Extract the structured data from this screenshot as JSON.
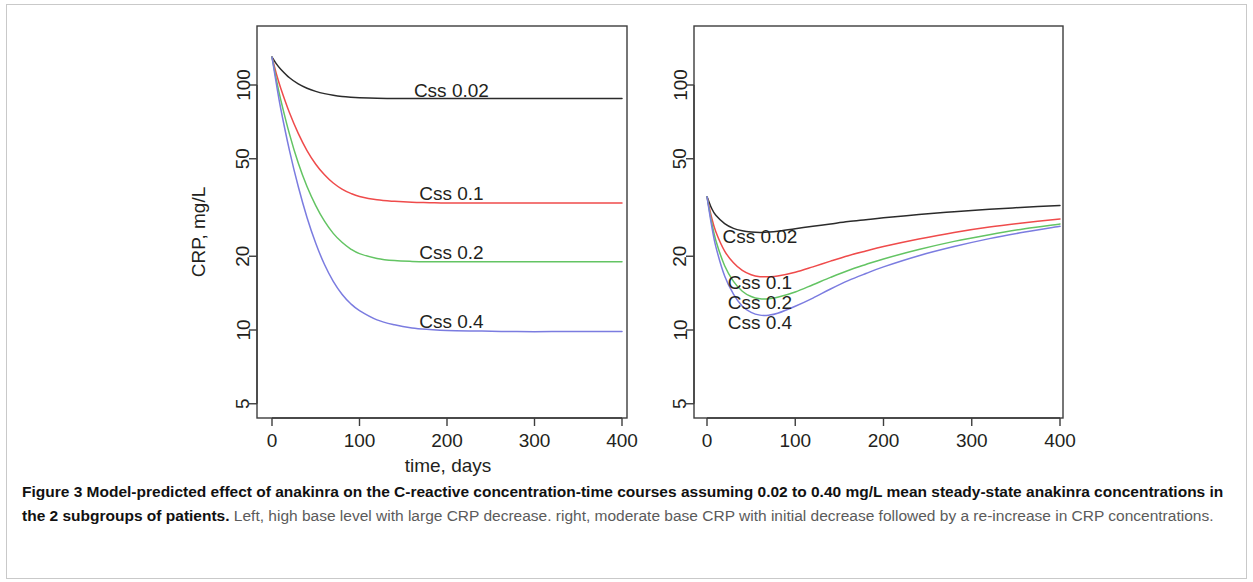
{
  "figure": {
    "caption_bold": "Figure 3 Model-predicted effect of anakinra on the C-reactive concentration-time courses assuming 0.02 to 0.40 mg/L mean steady-state anakinra concentrations in the 2 subgroups of patients.",
    "caption_rest": " Left, high base level with large CRP decrease. right, moderate base CRP with initial decrease followed by a re-increase in CRP concentrations.",
    "shared_xlabel": "time, days",
    "ylabel": "CRP, mg/L"
  },
  "colors": {
    "css_0_02": "#2b2b2b",
    "css_0_1": "#ef4b4b",
    "css_0_2": "#63c463",
    "css_0_4": "#7b7ce0",
    "axis": "#3d3d3d"
  },
  "chart_data": [
    {
      "type": "line",
      "panel": "left",
      "title": "",
      "xlabel": "time, days",
      "ylabel": "CRP, mg/L",
      "yscale": "log",
      "xlim": [
        0,
        400
      ],
      "ylim": [
        4,
        160
      ],
      "xticks": [
        0,
        100,
        200,
        300,
        400
      ],
      "xticklabels": [
        "0",
        "100",
        "200",
        "300",
        "400"
      ],
      "yticks": [
        5,
        10,
        20,
        50,
        100
      ],
      "yticklabels": [
        "5",
        "10",
        "20",
        "50",
        "100"
      ],
      "grid": false,
      "legend": "inline-labels",
      "x": [
        0,
        5,
        10,
        20,
        30,
        40,
        50,
        60,
        70,
        80,
        90,
        100,
        120,
        140,
        160,
        180,
        200,
        240,
        280,
        320,
        360,
        400
      ],
      "series": [
        {
          "name": "Css 0.02",
          "color": "#2b2b2b",
          "label_x": 205,
          "label_y": 95,
          "values": [
            130,
            122,
            116,
            107,
            101,
            97.0,
            94.2,
            92.2,
            90.8,
            89.8,
            89.2,
            88.8,
            88.3,
            88.1,
            88.0,
            88.0,
            88.0,
            88.0,
            88.0,
            88.0,
            88.0,
            88.0
          ]
        },
        {
          "name": "Css 0.1",
          "color": "#ef4b4b",
          "label_x": 205,
          "label_y": 36,
          "values": [
            130,
            111,
            97.0,
            77.0,
            63.5,
            54.0,
            47.5,
            43.0,
            39.8,
            37.6,
            36.1,
            35.1,
            34.0,
            33.5,
            33.2,
            33.1,
            33.0,
            33.0,
            33.0,
            33.0,
            33.0,
            33.0
          ]
        },
        {
          "name": "Css 0.2",
          "color": "#63c463",
          "label_x": 205,
          "label_y": 20.8,
          "values": [
            130,
            105,
            87.0,
            63.0,
            48.0,
            38.5,
            32.2,
            27.8,
            24.8,
            22.8,
            21.4,
            20.5,
            19.6,
            19.2,
            19.05,
            19.0,
            19.0,
            19.0,
            19.0,
            19.0,
            19.0,
            19.0
          ]
        },
        {
          "name": "Css 0.4",
          "color": "#7b7ce0",
          "label_x": 205,
          "label_y": 10.8,
          "values": [
            130,
            101,
            80.0,
            54.0,
            38.5,
            28.8,
            22.6,
            18.5,
            15.8,
            14.0,
            12.8,
            12.0,
            11.0,
            10.5,
            10.2,
            10.05,
            9.95,
            9.9,
            9.85,
            9.85,
            9.85,
            9.85
          ]
        }
      ]
    },
    {
      "type": "line",
      "panel": "right",
      "title": "",
      "xlabel": "time, days",
      "ylabel": "",
      "yscale": "log",
      "xlim": [
        0,
        400
      ],
      "ylim": [
        4,
        160
      ],
      "xticks": [
        0,
        100,
        200,
        300,
        400
      ],
      "xticklabels": [
        "0",
        "100",
        "200",
        "300",
        "400"
      ],
      "yticks": [
        5,
        10,
        20,
        50,
        100
      ],
      "yticklabels": [
        "5",
        "10",
        "20",
        "50",
        "100"
      ],
      "grid": false,
      "legend": "inline-labels",
      "x": [
        0,
        5,
        10,
        20,
        30,
        40,
        50,
        60,
        70,
        80,
        100,
        120,
        140,
        160,
        180,
        200,
        240,
        280,
        320,
        360,
        400
      ],
      "series": [
        {
          "name": "Css 0.02",
          "color": "#2b2b2b",
          "label_x": 60,
          "label_y": 24.0,
          "values": [
            35.0,
            31.5,
            29.4,
            27.2,
            26.0,
            25.4,
            25.1,
            25.0,
            25.1,
            25.3,
            25.9,
            26.5,
            27.1,
            27.7,
            28.2,
            28.7,
            29.6,
            30.4,
            31.1,
            31.7,
            32.2
          ]
        },
        {
          "name": "Css 0.1",
          "color": "#ef4b4b",
          "label_x": 60,
          "label_y": 15.6,
          "values": [
            35.0,
            29.0,
            25.2,
            21.0,
            18.8,
            17.5,
            16.8,
            16.5,
            16.5,
            16.6,
            17.2,
            18.1,
            19.1,
            20.1,
            21.0,
            21.9,
            23.5,
            25.0,
            26.3,
            27.4,
            28.4
          ]
        },
        {
          "name": "Css 0.2",
          "color": "#63c463",
          "label_x": 60,
          "label_y": 12.9,
          "values": [
            35.0,
            27.8,
            23.2,
            18.3,
            15.8,
            14.4,
            13.7,
            13.4,
            13.4,
            13.6,
            14.3,
            15.3,
            16.4,
            17.5,
            18.5,
            19.5,
            21.3,
            23.0,
            24.5,
            25.9,
            27.1
          ]
        },
        {
          "name": "Css 0.4",
          "color": "#7b7ce0",
          "label_x": 60,
          "label_y": 10.7,
          "values": [
            35.0,
            27.0,
            21.9,
            16.6,
            14.0,
            12.5,
            11.8,
            11.5,
            11.5,
            11.7,
            12.5,
            13.5,
            14.7,
            15.9,
            17.0,
            18.1,
            20.1,
            21.9,
            23.6,
            25.1,
            26.5
          ]
        }
      ]
    }
  ]
}
